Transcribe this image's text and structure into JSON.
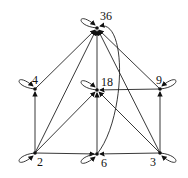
{
  "diagram": {
    "nodes": [
      {
        "id": "36",
        "label": "36",
        "x": 97,
        "y": 28,
        "lx": 100,
        "ly": 10
      },
      {
        "id": "4",
        "label": "4",
        "x": 35,
        "y": 89,
        "lx": 32,
        "ly": 74
      },
      {
        "id": "18",
        "label": "18",
        "x": 97,
        "y": 90,
        "lx": 101,
        "ly": 76
      },
      {
        "id": "9",
        "label": "9",
        "x": 160,
        "y": 89,
        "lx": 156,
        "ly": 74
      },
      {
        "id": "2",
        "label": "2",
        "x": 35,
        "y": 153,
        "lx": 37,
        "ly": 156
      },
      {
        "id": "6",
        "label": "6",
        "x": 97,
        "y": 154,
        "lx": 101,
        "ly": 157
      },
      {
        "id": "3",
        "label": "3",
        "x": 160,
        "y": 153,
        "lx": 150,
        "ly": 156
      }
    ],
    "edges": [
      [
        "2",
        "4"
      ],
      [
        "2",
        "36"
      ],
      [
        "2",
        "18"
      ],
      [
        "2",
        "6"
      ],
      [
        "4",
        "36"
      ],
      [
        "6",
        "18"
      ],
      [
        "6",
        "36"
      ],
      [
        "18",
        "36"
      ],
      [
        "9",
        "18"
      ],
      [
        "9",
        "36"
      ],
      [
        "3",
        "9"
      ],
      [
        "3",
        "6"
      ],
      [
        "3",
        "18"
      ],
      [
        "3",
        "36"
      ]
    ],
    "self_loops": [
      "36",
      "4",
      "18",
      "9",
      "2",
      "6",
      "3"
    ]
  }
}
